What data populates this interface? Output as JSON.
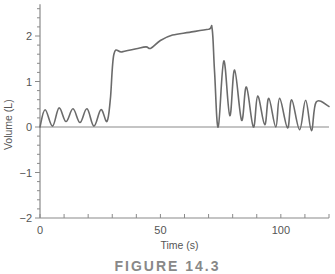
{
  "chart_data": {
    "type": "line",
    "title": "",
    "xlabel": "Time (s)",
    "ylabel": "Volume (L)",
    "xlim": [
      0,
      120
    ],
    "ylim": [
      -2,
      2.7
    ],
    "x_ticks": [
      0,
      50,
      100
    ],
    "x_tick_labels": [
      "0",
      "50",
      "100"
    ],
    "x_minor_step": 10,
    "y_ticks": [
      -2,
      -1,
      0,
      1,
      2
    ],
    "y_tick_labels": [
      "−2",
      "−1",
      "0",
      "1",
      "2"
    ],
    "y_minor_step": 0.2,
    "grid": false,
    "legend": null,
    "zero_line": true,
    "line_color": "#6b6b6b",
    "series": [
      {
        "name": "Volume",
        "x": [
          0,
          2.1,
          5.2,
          7.9,
          10.8,
          13.7,
          16.6,
          19.5,
          22.4,
          25.3,
          27.8,
          29.2,
          30.7,
          34,
          40,
          44,
          46,
          50,
          55,
          62,
          70,
          71.5,
          72.5,
          74,
          76.3,
          78.8,
          80.8,
          83.7,
          85.7,
          88.6,
          90.4,
          93.3,
          95,
          97.9,
          99.5,
          102.8,
          104.5,
          107.8,
          110.3,
          112.7,
          114.7,
          120
        ],
        "y": [
          0,
          0.38,
          0.02,
          0.42,
          0.12,
          0.4,
          0.1,
          0.4,
          0.02,
          0.38,
          0.12,
          0.6,
          1.6,
          1.65,
          1.72,
          1.76,
          1.73,
          1.9,
          2.02,
          2.08,
          2.15,
          2.15,
          1.2,
          0,
          1.45,
          0.25,
          1.25,
          0.15,
          0.88,
          0,
          0.68,
          0.05,
          0.63,
          0,
          0.63,
          -0.02,
          0.6,
          -0.06,
          0.59,
          -0.08,
          0.55,
          0.45
        ]
      }
    ],
    "annotations": [],
    "caption": "FIGURE 14.3"
  },
  "caption": "FIGURE 14.3"
}
